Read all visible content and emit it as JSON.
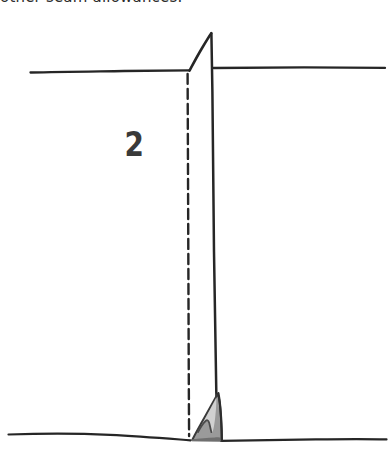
{
  "figure": {
    "caption": "other seam allowances.",
    "dart_number": "2",
    "background_color": "#ffffff",
    "ink_color": "#262626",
    "shade_fill_color": "#9a9a9a",
    "shade_highlight_color": "#c9c9c9",
    "width": 391,
    "height": 462
  },
  "elements": {
    "fold_apex_label": "fold-apex",
    "upper_left_edge_label": "upper-left-fabric-edge",
    "upper_right_edge_label": "upper-right-fabric-edge",
    "stitch_line_label": "stitching-line",
    "fold_line_label": "fold-line-dashed",
    "bottom_edge_label": "bottom-fabric-edge",
    "seam_allowance_label": "shaded-seam-allowance"
  }
}
